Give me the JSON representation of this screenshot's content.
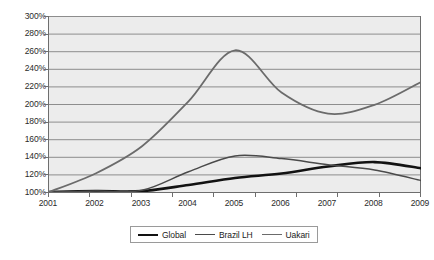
{
  "chart_data": {
    "type": "line",
    "title": "",
    "xlabel": "",
    "ylabel": "",
    "grid": true,
    "legend_position": "bottom",
    "x": [
      2001,
      2002,
      2003,
      2004,
      2005,
      2006,
      2007,
      2008,
      2009
    ],
    "xtick_labels": [
      "2001",
      "2002",
      "2003",
      "2004",
      "2005",
      "2006",
      "2007",
      "2008",
      "2009"
    ],
    "ytick_labels": [
      "300%",
      "280%",
      "260%",
      "240%",
      "220%",
      "200%",
      "180%",
      "160%",
      "140%",
      "120%",
      "100%"
    ],
    "ytick_values": [
      300,
      280,
      260,
      240,
      220,
      200,
      180,
      160,
      140,
      120,
      100
    ],
    "ylim": [
      100,
      300
    ],
    "xlim": [
      2001,
      2009
    ],
    "series": [
      {
        "name": "Global",
        "color": "#121212",
        "width": 2.6,
        "values": [
          100,
          101,
          101,
          108,
          116,
          121,
          129,
          134,
          127
        ]
      },
      {
        "name": "Brazil LH",
        "color": "#4a4a4a",
        "width": 1.5,
        "values": [
          100,
          101,
          102,
          123,
          141,
          138,
          131,
          125,
          113
        ]
      },
      {
        "name": "Uakari",
        "color": "#6b6b6b",
        "width": 1.8,
        "values": [
          100,
          121,
          152,
          203,
          261,
          213,
          189,
          199,
          225
        ]
      }
    ]
  },
  "legend": {
    "items": [
      {
        "label": "Global"
      },
      {
        "label": "Brazil LH"
      },
      {
        "label": "Uakari"
      }
    ]
  },
  "colors": {
    "plot_background": "#ececec",
    "gridline": "#8d8d8d",
    "axis": "#6e6e6e",
    "page_background": "#ffffff",
    "text": "#2b2b2b"
  }
}
